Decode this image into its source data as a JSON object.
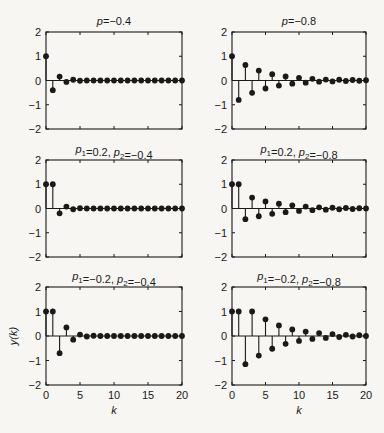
{
  "figure": {
    "background": "#f7f6f3",
    "ink": "#1a1a1a",
    "xlabel": "k",
    "ylabel": "y(k)"
  },
  "chart_data": [
    {
      "type": "stem",
      "title": "p=−0.4",
      "title_parts": [
        {
          "t": "p",
          "i": true
        },
        {
          "t": "=−0.4"
        }
      ],
      "xlim": [
        0,
        20
      ],
      "ylim": [
        -2,
        2
      ],
      "xticks": [
        0,
        5,
        10,
        15,
        20
      ],
      "yticks": [
        -2,
        -1,
        0,
        1,
        2
      ],
      "x": [
        0,
        1,
        2,
        3,
        4,
        5,
        6,
        7,
        8,
        9,
        10,
        11,
        12,
        13,
        14,
        15,
        16,
        17,
        18,
        19,
        20
      ],
      "values": [
        1,
        -0.4,
        0.16,
        -0.06,
        0.03,
        -0.01,
        0,
        0,
        0,
        0,
        0,
        0,
        0,
        0,
        0,
        0,
        0,
        0,
        0,
        0,
        0
      ]
    },
    {
      "type": "stem",
      "title": "p=−0.8",
      "title_parts": [
        {
          "t": "p",
          "i": true
        },
        {
          "t": "=−0.8"
        }
      ],
      "xlim": [
        0,
        20
      ],
      "ylim": [
        -2,
        2
      ],
      "xticks": [
        0,
        5,
        10,
        15,
        20
      ],
      "yticks": [
        -2,
        -1,
        0,
        1,
        2
      ],
      "x": [
        0,
        1,
        2,
        3,
        4,
        5,
        6,
        7,
        8,
        9,
        10,
        11,
        12,
        13,
        14,
        15,
        16,
        17,
        18,
        19,
        20
      ],
      "values": [
        1,
        -0.8,
        0.64,
        -0.51,
        0.41,
        -0.33,
        0.26,
        -0.21,
        0.17,
        -0.13,
        0.11,
        -0.09,
        0.07,
        -0.05,
        0.04,
        -0.04,
        0.03,
        -0.02,
        0.02,
        -0.01,
        0.01
      ]
    },
    {
      "type": "stem",
      "title": "p1=0.2, p2=−0.4",
      "title_parts": [
        {
          "t": "p",
          "i": true
        },
        {
          "t": "1",
          "sub": true
        },
        {
          "t": "=0.2,  "
        },
        {
          "t": "p",
          "i": true
        },
        {
          "t": "2",
          "sub": true
        },
        {
          "t": "=−0.4"
        }
      ],
      "xlim": [
        0,
        20
      ],
      "ylim": [
        -2,
        2
      ],
      "xticks": [
        0,
        5,
        10,
        15,
        20
      ],
      "yticks": [
        -2,
        -1,
        0,
        1,
        2
      ],
      "x": [
        0,
        1,
        2,
        3,
        4,
        5,
        6,
        7,
        8,
        9,
        10,
        11,
        12,
        13,
        14,
        15,
        16,
        17,
        18,
        19,
        20
      ],
      "values": [
        1,
        1,
        -0.2,
        0.08,
        -0.03,
        0.01,
        0,
        0,
        0,
        0,
        0,
        0,
        0,
        0,
        0,
        0,
        0,
        0,
        0,
        0,
        0
      ]
    },
    {
      "type": "stem",
      "title": "p1=0.2, p2=−0.8",
      "title_parts": [
        {
          "t": "p",
          "i": true
        },
        {
          "t": "1",
          "sub": true
        },
        {
          "t": "=0.2,  "
        },
        {
          "t": "p",
          "i": true
        },
        {
          "t": "2",
          "sub": true
        },
        {
          "t": "=−0.8"
        }
      ],
      "xlim": [
        0,
        20
      ],
      "ylim": [
        -2,
        2
      ],
      "xticks": [
        0,
        5,
        10,
        15,
        20
      ],
      "yticks": [
        -2,
        -1,
        0,
        1,
        2
      ],
      "x": [
        0,
        1,
        2,
        3,
        4,
        5,
        6,
        7,
        8,
        9,
        10,
        11,
        12,
        13,
        14,
        15,
        16,
        17,
        18,
        19,
        20
      ],
      "values": [
        1,
        1,
        -0.44,
        0.45,
        -0.32,
        0.29,
        -0.22,
        0.2,
        -0.15,
        0.13,
        -0.1,
        0.08,
        -0.07,
        0.05,
        -0.05,
        0.03,
        -0.03,
        0.02,
        -0.02,
        0.01,
        0
      ]
    },
    {
      "type": "stem",
      "title": "p1=−0.2, p2=−0.4",
      "title_parts": [
        {
          "t": "p",
          "i": true
        },
        {
          "t": "1",
          "sub": true
        },
        {
          "t": "=−0.2,  "
        },
        {
          "t": "p",
          "i": true
        },
        {
          "t": "2",
          "sub": true
        },
        {
          "t": "=−0.4"
        }
      ],
      "xlim": [
        0,
        20
      ],
      "ylim": [
        -2,
        2
      ],
      "xticks": [
        0,
        5,
        10,
        15,
        20
      ],
      "yticks": [
        -2,
        -1,
        0,
        1,
        2
      ],
      "x": [
        0,
        1,
        2,
        3,
        4,
        5,
        6,
        7,
        8,
        9,
        10,
        11,
        12,
        13,
        14,
        15,
        16,
        17,
        18,
        19,
        20
      ],
      "values": [
        1,
        1,
        -0.7,
        0.35,
        -0.15,
        0.06,
        -0.02,
        0.01,
        0,
        0,
        0,
        0,
        0,
        0,
        0,
        0,
        0,
        0,
        0,
        0,
        0
      ]
    },
    {
      "type": "stem",
      "title": "p1=−0.2, p2=−0.8",
      "title_parts": [
        {
          "t": "p",
          "i": true
        },
        {
          "t": "1",
          "sub": true
        },
        {
          "t": "=−0.2,  "
        },
        {
          "t": "p",
          "i": true
        },
        {
          "t": "2",
          "sub": true
        },
        {
          "t": "=−0.8"
        }
      ],
      "xlim": [
        0,
        20
      ],
      "ylim": [
        -2,
        2
      ],
      "xticks": [
        0,
        5,
        10,
        15,
        20
      ],
      "yticks": [
        -2,
        -1,
        0,
        1,
        2
      ],
      "x": [
        0,
        1,
        2,
        3,
        4,
        5,
        6,
        7,
        8,
        9,
        10,
        11,
        12,
        13,
        14,
        15,
        16,
        17,
        18,
        19,
        20
      ],
      "values": [
        1,
        1,
        -1.15,
        1.0,
        -0.8,
        0.68,
        -0.52,
        0.43,
        -0.32,
        0.27,
        -0.2,
        0.18,
        -0.12,
        0.12,
        -0.08,
        0.08,
        -0.04,
        0.05,
        -0.02,
        0.03,
        0
      ]
    }
  ]
}
